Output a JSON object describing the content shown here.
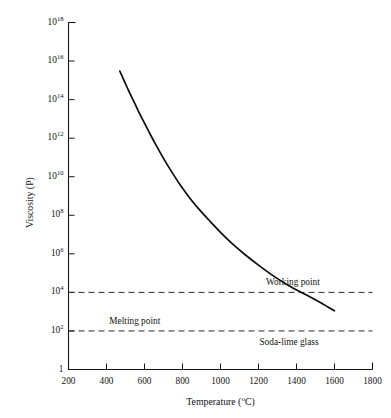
{
  "chart_data": {
    "type": "line",
    "title": "",
    "xlabel": "Temperature (°C)",
    "ylabel": "Viscosity (P)",
    "xlim": [
      200,
      1800
    ],
    "ylim": [
      1,
      1e+18
    ],
    "yscale": "log",
    "xscale": "linear",
    "grid": false,
    "legend": false,
    "xticks": [
      200,
      400,
      600,
      800,
      1000,
      1200,
      1400,
      1600,
      1800
    ],
    "xtick_labels": [
      "200",
      "400",
      "600",
      "800",
      "1000",
      "1200",
      "1400",
      "1600",
      "1800"
    ],
    "yticks": [
      1,
      100,
      10000,
      1000000,
      100000000,
      10000000000,
      1000000000000,
      100000000000000,
      1e+16,
      1e+18
    ],
    "ytick_labels": [
      "1",
      "10²",
      "10⁴",
      "10⁶",
      "10⁸",
      "10¹⁰",
      "10¹²",
      "10¹⁴",
      "10¹⁶",
      "10¹⁸"
    ],
    "ytick_mantissas": [
      "1",
      "10",
      "10",
      "10",
      "10",
      "10",
      "10",
      "10",
      "10",
      "10"
    ],
    "ytick_exponents": [
      "",
      "2",
      "4",
      "6",
      "8",
      "10",
      "12",
      "14",
      "16",
      "18"
    ],
    "series": [
      {
        "name": "Soda-lime glass",
        "x": [
          470,
          490,
          510,
          530,
          550,
          575,
          600,
          630,
          660,
          700,
          740,
          790,
          840,
          890,
          940,
          1000,
          1060,
          1130,
          1200,
          1280,
          1360,
          1450,
          1530,
          1600
        ],
        "y": [
          3000000000000000.0,
          1100000000000000.0,
          400000000000000.0,
          150000000000000.0,
          60000000000000.0,
          18000000000000.0,
          6000000000000.0,
          1600000000000.0,
          450000000000.0,
          90000000000.0,
          20000000000.0,
          3500000000.0,
          750000000.0,
          190000000.0,
          55000000.0,
          13000000.0,
          3500000.0,
          900000.0,
          260000.0,
          70000.0,
          22000.0,
          7500.0,
          2800.0,
          1100.0
        ]
      }
    ],
    "reference_lines": [
      {
        "label": "Working point",
        "value": 10000,
        "style": "dashed",
        "label_x": 1440,
        "label_y_offset": 22
      },
      {
        "label": "Melting point",
        "value": 100,
        "style": "dashed",
        "label_x": 530,
        "label_y_offset": 22
      }
    ],
    "annotations": [
      {
        "text": "Soda-lime glass",
        "x": 1380,
        "y": 40,
        "name": "curve-label"
      }
    ]
  },
  "figure": {
    "background_color": "#ffffff",
    "axis_color": "#161616",
    "curve_color": "#0d0d0d",
    "reference_line_color": "#2b2b2b"
  },
  "labels": {
    "working_point": "Working point",
    "melting_point": "Melting point",
    "soda_lime_glass": "Soda-lime glass",
    "x_axis_title_main": "Temperature (",
    "x_axis_title_deg": "o",
    "x_axis_title_tail": "C)",
    "y_axis_title": "Viscosity (P)"
  }
}
